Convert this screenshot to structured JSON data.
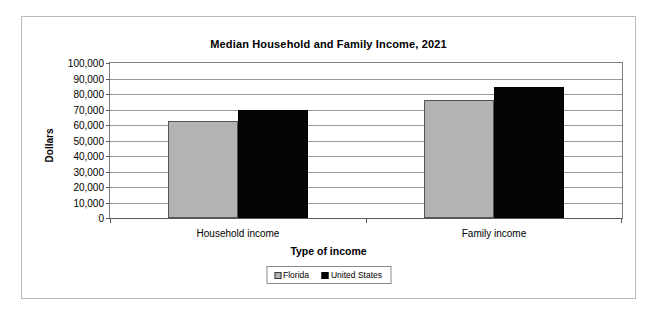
{
  "chart_data": {
    "type": "bar",
    "title": "Median Household and Family Income, 2021",
    "xlabel": "Type of income",
    "ylabel": "Dollars",
    "categories": [
      "Household income",
      "Family income"
    ],
    "series": [
      {
        "name": "Florida",
        "color": "#b3b3b3",
        "values": [
          62600,
          76100
        ]
      },
      {
        "name": "United States",
        "color": "#050505",
        "values": [
          69700,
          84500
        ]
      }
    ],
    "ylim": [
      0,
      100000
    ],
    "ytick_labels": [
      "100,000",
      "90,000",
      "80,000",
      "70,000",
      "60,000",
      "50,000",
      "40,000",
      "30,000",
      "20,000",
      "10,000",
      "0"
    ],
    "ytick_values": [
      100000,
      90000,
      80000,
      70000,
      60000,
      50000,
      40000,
      30000,
      20000,
      10000,
      0
    ],
    "grid": true,
    "legend_position": "bottom"
  }
}
